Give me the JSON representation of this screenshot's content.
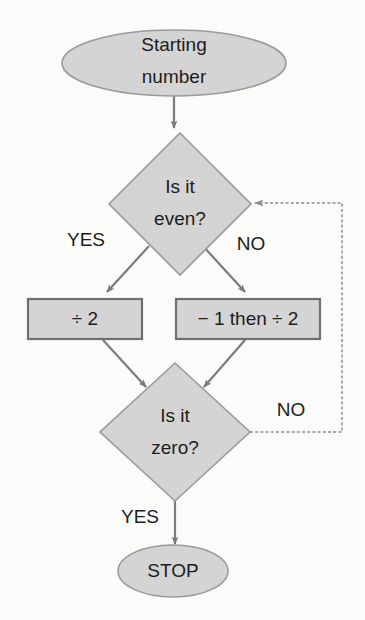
{
  "diagram": {
    "background_color": "#fbfbfa",
    "shape_fill_color": "#d4d4d4",
    "shape_stroke_color": "#9a9a9a",
    "box_stroke_color": "#6f6f6f",
    "line_color": "#7b7b7b",
    "text_color": "#1c1c1c"
  },
  "nodes": {
    "start": {
      "type": "terminal",
      "line1": "Starting",
      "line2": "number"
    },
    "decision_even": {
      "type": "decision",
      "line1": "Is it",
      "line2": "even?"
    },
    "process_halve": {
      "type": "process",
      "label": "÷ 2"
    },
    "process_minus_one_halve": {
      "type": "process",
      "label": "− 1 then ÷ 2"
    },
    "decision_zero": {
      "type": "decision",
      "line1": "Is it",
      "line2": "zero?"
    },
    "stop": {
      "type": "terminal",
      "label": "STOP"
    }
  },
  "edge_labels": {
    "even_yes": "YES",
    "even_no": "NO",
    "zero_no": "NO",
    "zero_yes": "YES"
  }
}
